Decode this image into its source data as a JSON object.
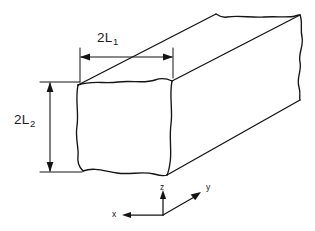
{
  "figure": {
    "type": "technical-line-diagram",
    "background_color": "#ffffff",
    "line_color": "#141414",
    "dimensions": [
      {
        "id": "width",
        "base": "2L",
        "subscript": "1",
        "full_text": "2L1",
        "orientation": "horizontal",
        "position": "above top face"
      },
      {
        "id": "height",
        "base": "2L",
        "subscript": "2",
        "full_text": "2L2",
        "orientation": "vertical",
        "position": "left of front face"
      }
    ],
    "axes": {
      "origin_label": "",
      "items": [
        {
          "id": "z",
          "label": "z",
          "direction": "up"
        },
        {
          "id": "y",
          "label": "y",
          "direction": "up-right"
        },
        {
          "id": "x",
          "label": "x",
          "direction": "left"
        }
      ]
    }
  }
}
